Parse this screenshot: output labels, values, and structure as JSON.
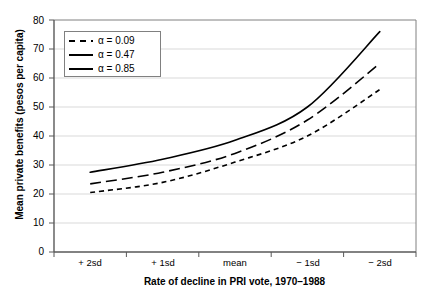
{
  "chart_data": {
    "type": "line",
    "title": "",
    "xlabel": "Rate of decline in PRI vote, 1970–1988",
    "ylabel": "Mean private benefits (pesos per capita)",
    "categories": [
      "+ 2sd",
      "+ 1sd",
      "mean",
      "− 1sd",
      "− 2sd"
    ],
    "ylim": [
      0,
      80
    ],
    "yticks": [
      0,
      10,
      20,
      30,
      40,
      50,
      60,
      70,
      80
    ],
    "grid": "horizontal",
    "legend_position": "top-left",
    "series": [
      {
        "name": "α = 0.09",
        "style": "short-dash",
        "color": "#000000",
        "values": [
          20.5,
          24.0,
          31.0,
          40.0,
          56.0
        ]
      },
      {
        "name": "α = 0.47",
        "style": "long-dash",
        "color": "#000000",
        "values": [
          23.5,
          27.5,
          34.0,
          45.5,
          65.0
        ]
      },
      {
        "name": "α = 0.85",
        "style": "solid",
        "color": "#000000",
        "values": [
          27.5,
          32.0,
          38.5,
          50.0,
          76.0
        ]
      }
    ]
  },
  "axis": {
    "y_tick_labels": [
      "80",
      "70",
      "60",
      "50",
      "40",
      "30",
      "20",
      "10",
      "0"
    ],
    "x_tick_labels": [
      "+ 2sd",
      "+ 1sd",
      "mean",
      "− 1sd",
      "− 2sd"
    ]
  },
  "legend": {
    "items": [
      {
        "label": "α = 0.09"
      },
      {
        "label": "α = 0.47"
      },
      {
        "label": "α = 0.85"
      }
    ]
  },
  "colors": {
    "line": "#000000",
    "grid": "#d9d9d9",
    "frame": "#808080",
    "background": "#ffffff"
  }
}
